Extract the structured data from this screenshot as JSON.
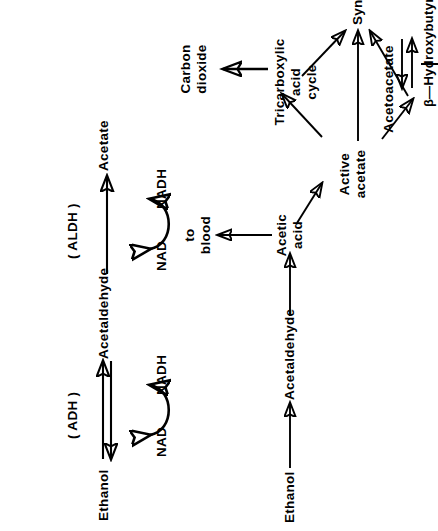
{
  "figure": {
    "background_color": "#ffffff",
    "ink_color": "#000000"
  },
  "top_scheme": {
    "name": "enzymatic oxidation of ethanol",
    "nodes": {
      "ethanol": "Ethanol",
      "acetaldehyde": "Acetaldehyde",
      "acetate": "Acetate"
    },
    "enzymes": {
      "adh": "( ADH )",
      "aldh": "( ALDH )"
    },
    "cofactors": {
      "adh_substrate": "NAD",
      "adh_product": "NADH",
      "aldh_substrate": "NAD",
      "aldh_product": "NADH"
    }
  },
  "bottom_scheme": {
    "name": "fate of acetate / active acetate",
    "nodes": {
      "ethanol": "Ethanol",
      "acetaldehyde": "Acetaldehyde",
      "acetic_acid_line1": "Acetic",
      "acetic_acid_line2": "acid",
      "to_blood_top_line1": "to",
      "to_blood_top_line2": "blood",
      "active_acetate_line1": "Active",
      "active_acetate_line2": "acetate",
      "tca_line1": "Tricarboxylic",
      "tca_line2": "acid",
      "tca_line3": "cycle",
      "carbon_dioxide_line1": "Carbon",
      "carbon_dioxide_line2": "dioxide",
      "synthesis": "Synthesis",
      "acetoacetate": "Acetoacetate",
      "hydroxybutyric_acid": "β—Hydroxybutyric  acid",
      "to_blood_bottom_line1": "to",
      "to_blood_bottom_line2": "blood"
    }
  }
}
